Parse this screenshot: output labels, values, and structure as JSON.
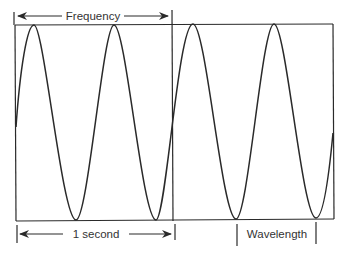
{
  "diagram": {
    "labels": {
      "frequency": "Frequency",
      "one_second": "1 second",
      "wavelength": "Wavelength"
    },
    "wave": {
      "cycles_in_one_second": 2,
      "total_cycles_shown": 4,
      "line_color": "#2a2a2a"
    },
    "colors": {
      "background": "#ffffff",
      "stroke": "#2a2a2a",
      "text": "#333333"
    }
  }
}
